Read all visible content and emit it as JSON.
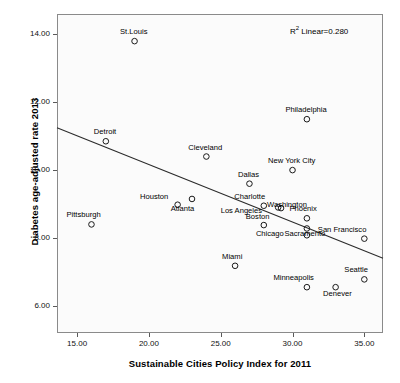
{
  "chart_data": {
    "type": "scatter",
    "title": "",
    "xlabel": "Sustainable Cities Policy Index for 2011",
    "ylabel": "Diabetes age-adjusted rate 2013",
    "xlim": [
      13.6,
      36.3
    ],
    "ylim": [
      5.2,
      14.6
    ],
    "xticks": [
      "15.00",
      "20.00",
      "25.00",
      "30.00",
      "35.00"
    ],
    "xtick_values": [
      15,
      20,
      25,
      30,
      35
    ],
    "yticks": [
      "6.00",
      "8.00",
      "10.00",
      "12.00",
      "14.00"
    ],
    "ytick_values": [
      6,
      8,
      10,
      12,
      14
    ],
    "grid": false,
    "legend": "none",
    "annotation": "R2 Linear=0.280",
    "annotation_prefix": "R",
    "annotation_sup": "2",
    "annotation_suffix": " Linear=0.280",
    "r_squared": 0.28,
    "marker": "open-circle",
    "fit_line": {
      "type": "linear",
      "x_start": 13.6,
      "y_start": 11.25,
      "x_end": 36.3,
      "y_end": 7.4
    },
    "points": [
      {
        "label": "St.Louis",
        "x": 19.0,
        "y": 13.8,
        "lx": -1,
        "ly": -11
      },
      {
        "label": "Philadelphia",
        "x": 31.0,
        "y": 11.5,
        "lx": -1,
        "ly": -11
      },
      {
        "label": "Detroit",
        "x": 17.0,
        "y": 10.85,
        "lx": -1,
        "ly": -11
      },
      {
        "label": "Cleveland",
        "x": 24.0,
        "y": 10.4,
        "lx": -1,
        "ly": -11
      },
      {
        "label": "New York City",
        "x": 30.0,
        "y": 10.0,
        "lx": -1,
        "ly": -11
      },
      {
        "label": "Dallas",
        "x": 27.0,
        "y": 9.6,
        "lx": -1,
        "ly": -11
      },
      {
        "label": "Houston",
        "x": 23.0,
        "y": 9.15,
        "lx": -38,
        "ly": -4
      },
      {
        "label": "Atlanta",
        "x": 22.0,
        "y": 8.98,
        "lx": 5,
        "ly": 2
      },
      {
        "label": "Charlotte",
        "x": 28.0,
        "y": 8.95,
        "lx": -14,
        "ly": -11
      },
      {
        "label": "Los Angeles",
        "x": 29.0,
        "y": 8.9,
        "lx": -37,
        "ly": 2
      },
      {
        "label": "Washington",
        "x": 29.2,
        "y": 8.88,
        "lx": 6,
        "ly": -5
      },
      {
        "label": "Phoenix",
        "x": 31.0,
        "y": 8.58,
        "lx": -4,
        "ly": -11
      },
      {
        "label": "Pittsburgh",
        "x": 16.0,
        "y": 8.4,
        "lx": -8,
        "ly": -11
      },
      {
        "label": "Boston",
        "x": 28.0,
        "y": 8.38,
        "lx": -6,
        "ly": -10
      },
      {
        "label": "Sacramento",
        "x": 31.0,
        "y": 8.28,
        "lx": -2,
        "ly": 4
      },
      {
        "label": "Chicago",
        "x": 31.0,
        "y": 8.08,
        "lx": -37,
        "ly": -3
      },
      {
        "label": "San Francisco",
        "x": 35.0,
        "y": 7.98,
        "lx": -22,
        "ly": -11
      },
      {
        "label": "Miami",
        "x": 26.0,
        "y": 7.18,
        "lx": -3,
        "ly": -11
      },
      {
        "label": "Seattle",
        "x": 35.0,
        "y": 6.78,
        "lx": -8,
        "ly": -11
      },
      {
        "label": "Minneapolis",
        "x": 31.0,
        "y": 6.55,
        "lx": -13,
        "ly": -11
      },
      {
        "label": "Denever",
        "x": 33.0,
        "y": 6.55,
        "lx": 2,
        "ly": 5
      }
    ]
  }
}
